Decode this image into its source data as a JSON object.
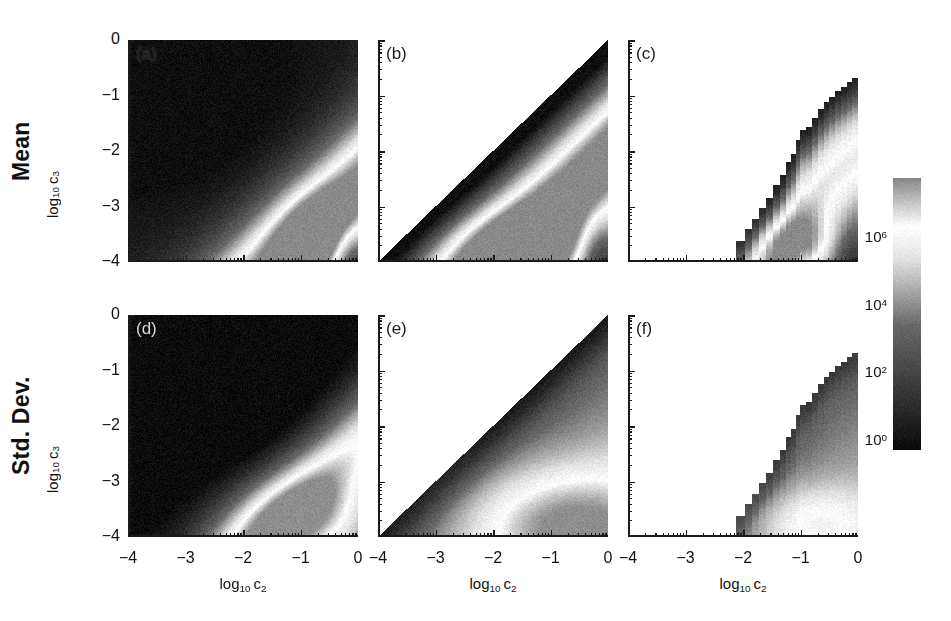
{
  "figure": {
    "width": 951,
    "height": 621,
    "background": "#ffffff",
    "row_labels": [
      "Mean",
      "Std. Dev."
    ]
  },
  "axes": {
    "x_title_prefix": "log",
    "x_title_base": "10",
    "x_title_var": "c",
    "x_title_var_sub": "2",
    "y_title_prefix": "log",
    "y_title_base": "10",
    "y_title_var": "c",
    "y_title_var_sub": "3",
    "x_ticks": [
      "-4",
      "-3",
      "-2",
      "-1",
      "0"
    ],
    "y_ticks": [
      "0",
      "-1",
      "-2",
      "-3",
      "-4"
    ],
    "x_range": [
      -4,
      0
    ],
    "y_range": [
      -4,
      0
    ],
    "minor_ticks_per_decade": 9,
    "tick_direction": "in"
  },
  "panels": [
    {
      "tag": "(a)",
      "row": "Mean",
      "col": 1,
      "domain": "full-square",
      "tag_color": "dark",
      "description": "Full c2-c3 plane; dark upper-left, bright diagonal band from lower-left to lower-right."
    },
    {
      "tag": "(b)",
      "row": "Mean",
      "col": 2,
      "domain": "lower-triangle",
      "tag_color": "dark",
      "description": "Data only where log10 c3 <= log10 c2; bright band parallel below the diagonal."
    },
    {
      "tag": "(c)",
      "row": "Mean",
      "col": 3,
      "domain": "stepped-wedge",
      "tag_color": "dark",
      "description": "Narrow stepped wedge confined to lower-right corner, onset near log10 c2 = -2.1."
    },
    {
      "tag": "(d)",
      "row": "Std. Dev.",
      "col": 1,
      "domain": "full-square",
      "tag_color": "light",
      "description": "Full plane; darker overall than (a), bright band along bottom-right."
    },
    {
      "tag": "(e)",
      "row": "Std. Dev.",
      "col": 2,
      "domain": "lower-triangle",
      "tag_color": "dark",
      "description": "Lower triangle; brightest along the bottom edge toward the right."
    },
    {
      "tag": "(f)",
      "row": "Std. Dev.",
      "col": 3,
      "domain": "stepped-wedge",
      "tag_color": "dark",
      "description": "Stepped wedge in lower-right, same support as (c)."
    }
  ],
  "colorbar": {
    "orientation": "vertical",
    "scale": "log",
    "ticks": [
      {
        "base": "10",
        "exp": "6"
      },
      {
        "base": "10",
        "exp": "4"
      },
      {
        "base": "10",
        "exp": "2"
      },
      {
        "base": "10",
        "exp": "0"
      }
    ],
    "low_color": "#000000",
    "high_color": "#8a8a8a",
    "peak_color": "#ffffff"
  },
  "chart_data": {
    "type": "heatmap",
    "title": "",
    "xlabel": "log10 c2",
    "ylabel": "log10 c3",
    "xlim": [
      -4,
      0
    ],
    "ylim": [
      -4,
      0
    ],
    "grid": false,
    "legend": "colorbar-right",
    "colorbar": {
      "scale": "log",
      "tick_values": [
        1,
        100,
        10000,
        1000000
      ],
      "tick_labels": [
        "10^0",
        "10^2",
        "10^4",
        "10^6"
      ],
      "vmin": 1,
      "vmax": 10000000
    },
    "rows": [
      "Mean",
      "Std. Dev."
    ],
    "columns": [
      "(a)/(d) full plane",
      "(b)/(e) c3<=c2",
      "(c)/(f) restricted"
    ],
    "panels": [
      {
        "tag": "(a)",
        "row": "Mean",
        "column": 1,
        "support": "full square over x in [-4,0], y in [-4,0]",
        "value_min": 1,
        "value_max": 1000000,
        "features": [
          "dark (low) plateau in the upper-left region, values near 10^1-10^2",
          "values increase monotonically toward the lower-right",
          "a broad bright ridge (values ~10^5-10^6) runs diagonally from near (-4,-3.8) to (0,-2.5)",
          "a secondary brightest lobe sits in the bottom-right corner near (-0.3,-3.9)",
          "a darker re-entrant wedge appears at the far bottom-right corner"
        ]
      },
      {
        "tag": "(b)",
        "row": "Mean",
        "column": 2,
        "support": "lower triangle where y <= x (log10 c3 <= log10 c2)",
        "value_min": 1,
        "value_max": 1000000,
        "features": [
          "blank/white above the main diagonal",
          "dark values (~10^1) immediately under the diagonal",
          "bright band (~10^5) parallel to and below the diagonal",
          "brightest values along the bottom edge toward the right"
        ]
      },
      {
        "tag": "(c)",
        "row": "Mean",
        "column": 3,
        "support": "stepped wedge, onset near x = -2.1, confined to lower-right",
        "value_min": 1,
        "value_max": 1000000,
        "features": [
          "white (no data) over most of the panel",
          "staircase upper boundary rising from (-2.1,-3.9) to (0,-0.6)",
          "bright ridge inside the wedge near the bottom-right",
          "dark edge along the staircase boundary"
        ]
      },
      {
        "tag": "(d)",
        "row": "Std. Dev.",
        "column": 1,
        "support": "full square over x in [-4,0], y in [-4,0]",
        "value_min": 1,
        "value_max": 1000000,
        "features": [
          "very dark (near 10^0-10^1) over the whole upper-left half",
          "gradient brightening toward the lower-right",
          "bright band along the bottom edge and bottom-right corner (~10^5)",
          "overall darker than panel (a)"
        ]
      },
      {
        "tag": "(e)",
        "row": "Std. Dev.",
        "column": 2,
        "support": "lower triangle where y <= x",
        "value_min": 1,
        "value_max": 1000000,
        "features": [
          "blank above the diagonal",
          "dark just below the diagonal",
          "smooth brightening toward the bottom-right corner",
          "brightest strip hugging the bottom axis"
        ]
      },
      {
        "tag": "(f)",
        "row": "Std. Dev.",
        "column": 3,
        "support": "stepped wedge identical to (c)",
        "value_min": 1,
        "value_max": 1000000,
        "features": [
          "white over most of the panel",
          "staircase boundary rising from (-2.1,-3.9) to (0,-0.6)",
          "uniformly mid-gray interior, brighter near the bottom axis"
        ]
      }
    ]
  }
}
